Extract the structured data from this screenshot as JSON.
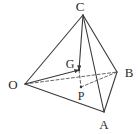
{
  "figure": {
    "type": "geometry-diagram",
    "shape_name": "tetrahedron",
    "canvas": {
      "width": 139,
      "height": 134,
      "background": "#ffffff"
    },
    "stroke": {
      "solid_color": "#3a3a3a",
      "dashed_color": "#555555",
      "solid_width": 1.1,
      "dashed_width": 0.9,
      "dash_pattern": "3,2.2"
    },
    "label_color": "#2b2b2b",
    "vertices": [
      {
        "id": "C",
        "label": "C",
        "point_x": 83,
        "point_y": 15,
        "label_x": 80,
        "label_y": 6,
        "dot": false
      },
      {
        "id": "O",
        "label": "O",
        "point_x": 25,
        "point_y": 84,
        "label_x": 13,
        "label_y": 84,
        "dot": false
      },
      {
        "id": "B",
        "label": "B",
        "point_x": 117,
        "point_y": 72,
        "label_x": 129,
        "label_y": 72,
        "dot": false
      },
      {
        "id": "A",
        "label": "A",
        "point_x": 104,
        "point_y": 112,
        "label_x": 104,
        "label_y": 124,
        "dot": false
      },
      {
        "id": "G",
        "label": "G",
        "point_x": 79,
        "point_y": 70,
        "label_x": 70,
        "label_y": 64,
        "dot": true
      },
      {
        "id": "P",
        "label": "P",
        "point_x": 81,
        "point_y": 87,
        "label_x": 81,
        "label_y": 96,
        "dot": true
      }
    ],
    "edges": [
      {
        "id": "OC",
        "from": "O",
        "to": "C",
        "style": "solid",
        "hidden": false
      },
      {
        "id": "CB",
        "from": "C",
        "to": "B",
        "style": "solid",
        "hidden": false
      },
      {
        "id": "CA",
        "from": "C",
        "to": "A",
        "style": "solid",
        "hidden": false
      },
      {
        "id": "OA",
        "from": "O",
        "to": "A",
        "style": "solid",
        "hidden": false
      },
      {
        "id": "AB",
        "from": "A",
        "to": "B",
        "style": "solid",
        "hidden": false
      },
      {
        "id": "OB",
        "from": "O",
        "to": "B",
        "style": "dashed",
        "hidden": true
      }
    ],
    "constructions": [
      {
        "id": "CG",
        "label": "",
        "from": "C",
        "to": "G",
        "style": "solid",
        "arrow": true,
        "note": "altitude from apex to centroid"
      },
      {
        "id": "OG",
        "label": "",
        "from": "O",
        "to": "G",
        "style": "solid",
        "arrow": true,
        "note": "segment from O to G"
      },
      {
        "id": "GP",
        "label": "",
        "from": "G",
        "to": "P",
        "style": "dashed",
        "arrow": false,
        "note": "vertical drop from G to P"
      },
      {
        "id": "BP",
        "label": "",
        "from": "B",
        "to": "P",
        "style": "dashed",
        "arrow": false,
        "note": "hidden segment toward P"
      }
    ]
  }
}
